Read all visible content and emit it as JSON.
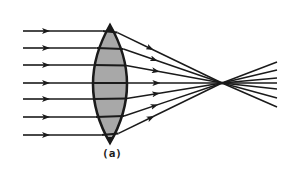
{
  "figure": {
    "caption": "(a)"
  },
  "colors": {
    "background": "#ffffff",
    "ink": "#1a1a1a",
    "lens_fill": "#a8a8a8"
  },
  "lens": {
    "type": "biconvex",
    "cx": 110,
    "top_y": 25,
    "bottom_y": 143,
    "half_width": 17
  },
  "rays": {
    "start_x": 23,
    "arrow_x": 48,
    "y_positions": [
      31,
      48,
      65,
      83,
      99,
      117,
      135
    ],
    "focal_point": {
      "x": 222,
      "y": 83
    },
    "exit_x": 277,
    "exit_y_positions": [
      62,
      70,
      78,
      83,
      89,
      98,
      107
    ]
  }
}
